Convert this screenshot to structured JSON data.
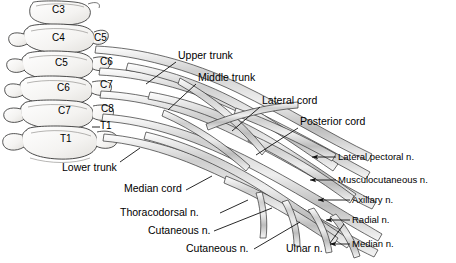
{
  "figure": {
    "ink_color": "#1a1a1a",
    "nerve_fill": "#d8d8d8",
    "bone_fill": "#f2f1ef",
    "background": "#ffffff"
  },
  "vertebrae": [
    {
      "id": "v-c3",
      "label": "C3",
      "x": 52,
      "y": 10
    },
    {
      "id": "v-c4",
      "label": "C4",
      "x": 52,
      "y": 38
    },
    {
      "id": "v-c5",
      "label": "C5",
      "x": 55,
      "y": 63
    },
    {
      "id": "v-c6",
      "label": "C6",
      "x": 57,
      "y": 88
    },
    {
      "id": "v-c7",
      "label": "C7",
      "x": 58,
      "y": 111
    },
    {
      "id": "v-t1",
      "label": "T1",
      "x": 60,
      "y": 139
    }
  ],
  "roots": [
    {
      "id": "root-c5",
      "label": "C5",
      "x": 94,
      "y": 38
    },
    {
      "id": "root-c6",
      "label": "C6",
      "x": 100,
      "y": 62
    },
    {
      "id": "root-c7",
      "label": "C7",
      "x": 100,
      "y": 85
    },
    {
      "id": "root-c8",
      "label": "C8",
      "x": 101,
      "y": 109
    },
    {
      "id": "root-t1",
      "label": "T1",
      "x": 100,
      "y": 126,
      "dash": true
    }
  ],
  "trunks": [
    {
      "id": "upper-trunk",
      "label": "Upper trunk",
      "x": 178,
      "y": 55
    },
    {
      "id": "middle-trunk",
      "label": "Middle trunk",
      "x": 198,
      "y": 77
    },
    {
      "id": "lower-trunk",
      "label": "Lower trunk",
      "x": 62,
      "y": 167
    }
  ],
  "cords": [
    {
      "id": "lateral-cord",
      "label": "Lateral cord",
      "x": 262,
      "y": 100
    },
    {
      "id": "posterior-cord",
      "label": "Posterior cord",
      "x": 300,
      "y": 121
    },
    {
      "id": "median-cord",
      "label": "Median cord",
      "x": 124,
      "y": 188
    }
  ],
  "terminal_nerves_right": [
    {
      "id": "lateral-pectoral-n",
      "label": "Lateral pectoral n.",
      "x": 338,
      "y": 156
    },
    {
      "id": "musculocutaneous-n",
      "label": "Musculocutaneous n.",
      "x": 338,
      "y": 179
    },
    {
      "id": "axillary-n",
      "label": "Axillary n.",
      "x": 352,
      "y": 199
    },
    {
      "id": "radial-n",
      "label": "Radial n.",
      "x": 352,
      "y": 219
    },
    {
      "id": "median-n",
      "label": "Median n.",
      "x": 352,
      "y": 243
    }
  ],
  "terminal_nerves_bottom": [
    {
      "id": "thoracodorsal-n",
      "label": "Thoracodorsal n.",
      "x": 120,
      "y": 212
    },
    {
      "id": "cutaneous-n-1",
      "label": "Cutaneous n.",
      "x": 148,
      "y": 230
    },
    {
      "id": "cutaneous-n-2",
      "label": "Cutaneous n.",
      "x": 186,
      "y": 248
    },
    {
      "id": "ulnar-n",
      "label": "Ulnar n.",
      "x": 286,
      "y": 248
    }
  ]
}
